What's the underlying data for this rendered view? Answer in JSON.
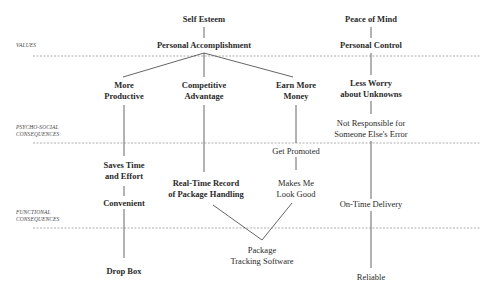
{
  "diagram": {
    "type": "means-end ladder",
    "levels": [
      {
        "id": "values",
        "label": "VALUES"
      },
      {
        "id": "psycho_social",
        "label_line1": "PSYCHO-SOCIAL",
        "label_line2": "CONSEQUENCES"
      },
      {
        "id": "functional",
        "label_line1": "FUNCTIONAL",
        "label_line2": "CONSEQUENCES"
      }
    ],
    "nodes": {
      "self_esteem": "Self Esteem",
      "personal_accomplishment": "Personal Accomplishment",
      "peace_of_mind": "Peace of Mind",
      "personal_control": "Personal Control",
      "more_productive": {
        "line1": "More",
        "line2": "Productive"
      },
      "competitive_advantage": {
        "line1": "Competitive",
        "line2": "Advantage"
      },
      "earn_more_money": {
        "line1": "Earn More",
        "line2": "Money"
      },
      "less_worry": {
        "line1": "Less Worry",
        "line2": "about Unknowns"
      },
      "not_responsible": {
        "line1": "Not Responsible for",
        "line2": "Someone Else's Error"
      },
      "saves_time": {
        "line1": "Saves Time",
        "line2": "and Effort"
      },
      "get_promoted": "Get Promoted",
      "real_time_record": {
        "line1": "Real-Time Record",
        "line2": "of Package Handling"
      },
      "makes_me_look_good": {
        "line1": "Makes Me",
        "line2": "Look Good"
      },
      "convenient": "Convenient",
      "on_time_delivery": "On-Time Delivery",
      "package_tracking": {
        "line1": "Package",
        "line2": "Tracking Software"
      },
      "drop_box": "Drop Box",
      "reliable": "Reliable"
    },
    "edges": [
      [
        "self_esteem",
        "personal_accomplishment"
      ],
      [
        "personal_accomplishment",
        "more_productive"
      ],
      [
        "personal_accomplishment",
        "competitive_advantage"
      ],
      [
        "personal_accomplishment",
        "earn_more_money"
      ],
      [
        "peace_of_mind",
        "personal_control"
      ],
      [
        "personal_control",
        "less_worry"
      ],
      [
        "less_worry",
        "not_responsible"
      ],
      [
        "not_responsible",
        "on_time_delivery"
      ],
      [
        "more_productive",
        "saves_time"
      ],
      [
        "saves_time",
        "convenient"
      ],
      [
        "convenient",
        "drop_box"
      ],
      [
        "competitive_advantage",
        "real_time_record"
      ],
      [
        "earn_more_money",
        "get_promoted"
      ],
      [
        "get_promoted",
        "makes_me_look_good"
      ],
      [
        "real_time_record",
        "package_tracking"
      ],
      [
        "makes_me_look_good",
        "package_tracking"
      ],
      [
        "on_time_delivery",
        "reliable"
      ]
    ],
    "colors": {
      "line": "#555555",
      "divider": "#999999",
      "text": "#2a2a2a"
    }
  }
}
